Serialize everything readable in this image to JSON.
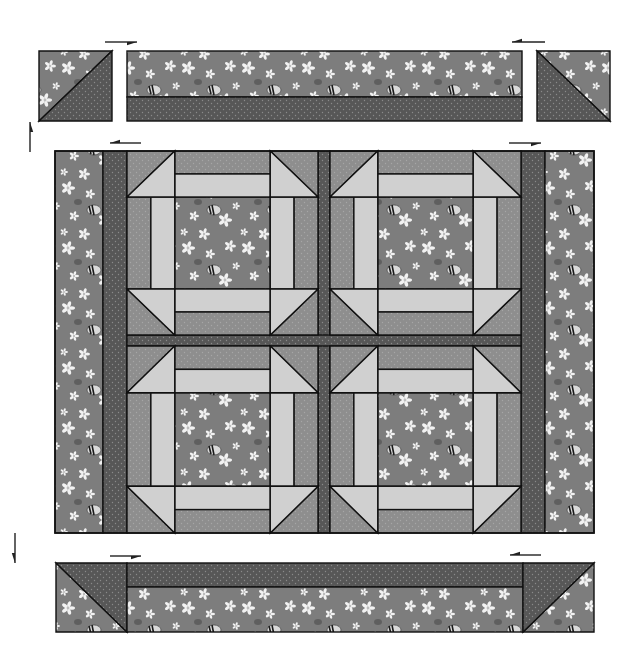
{
  "diagram": {
    "width": 634,
    "height": 661
  },
  "colors": {
    "background": "#ffffff",
    "outline": "#111111",
    "print_bg": "#7d7d7d",
    "print_flower": "#f2f2f2",
    "print_bee_body": "#d9d9d9",
    "print_bee_stripe": "#1a1a1a",
    "dark": "#575757",
    "dark_dot": "#8a8a8a",
    "medium": "#8e8e8e",
    "medium_dot": "#a6a6a6",
    "light": "#d0d0d0",
    "arrow": "#222222"
  },
  "top_row": {
    "left_square": {
      "x": 39,
      "y": 51,
      "w": 73,
      "h": 70,
      "diagonal": "bl-tr",
      "print_side": "top-left",
      "dark_side": "bottom-right"
    },
    "strip": {
      "x": 127,
      "y": 51,
      "w": 395,
      "h": 70,
      "print_h": 46,
      "dark_h": 24
    },
    "right_square": {
      "x": 537,
      "y": 51,
      "w": 73,
      "h": 70,
      "diagonal": "tl-br",
      "print_side": "top-right",
      "dark_side": "bottom-left"
    }
  },
  "main": {
    "x": 55,
    "y": 151,
    "w": 539,
    "h": 382,
    "left_border": {
      "x": 55,
      "w": 48
    },
    "left_sash": {
      "x": 103,
      "w": 24
    },
    "right_sash": {
      "x": 521,
      "w": 24
    },
    "right_border": {
      "x": 545,
      "w": 49
    },
    "center_vsash": {
      "x": 318,
      "w": 12
    },
    "center_hsash": {
      "y": 335,
      "h": 11
    },
    "blocks": [
      {
        "name": "block-top-left",
        "x": 127,
        "y": 151,
        "w": 191,
        "h": 184
      },
      {
        "name": "block-top-right",
        "x": 330,
        "y": 151,
        "w": 191,
        "h": 184
      },
      {
        "name": "block-bottom-left",
        "x": 127,
        "y": 346,
        "w": 191,
        "h": 187
      },
      {
        "name": "block-bottom-right",
        "x": 330,
        "y": 346,
        "w": 191,
        "h": 187
      }
    ],
    "block_proportions": {
      "corner": 0.25,
      "outer_rail": 0.125,
      "inner_rail": 0.125,
      "center": 0.5
    }
  },
  "bottom_row": {
    "x": 56,
    "y": 563,
    "w": 538,
    "h": 69,
    "left_square": {
      "x": 56,
      "w": 71,
      "diagonal": "tl-br",
      "print_side": "bottom-left",
      "dark_side": "top-right"
    },
    "strip": {
      "x": 127,
      "w": 396,
      "dark_h": 24,
      "print_h": 45
    },
    "right_square": {
      "x": 523,
      "w": 71,
      "diagonal": "bl-tr",
      "print_side": "bottom-right",
      "dark_side": "top-left"
    }
  },
  "arrows": [
    {
      "name": "press-arrow-top-strip-right",
      "x1": 105,
      "y1": 42,
      "x2": 137,
      "y2": 42
    },
    {
      "name": "press-arrow-top-strip-left",
      "x1": 545,
      "y1": 42,
      "x2": 512,
      "y2": 42
    },
    {
      "name": "press-arrow-top-row-up",
      "x1": 30,
      "y1": 152,
      "x2": 30,
      "y2": 122
    },
    {
      "name": "press-arrow-main-left",
      "x1": 141,
      "y1": 143,
      "x2": 110,
      "y2": 143
    },
    {
      "name": "press-arrow-main-right",
      "x1": 509,
      "y1": 143,
      "x2": 541,
      "y2": 143
    },
    {
      "name": "press-arrow-bottom-row-down",
      "x1": 15,
      "y1": 533,
      "x2": 15,
      "y2": 563
    },
    {
      "name": "press-arrow-bottom-strip-right",
      "x1": 110,
      "y1": 556,
      "x2": 141,
      "y2": 556
    },
    {
      "name": "press-arrow-bottom-strip-left",
      "x1": 541,
      "y1": 555,
      "x2": 510,
      "y2": 555
    }
  ]
}
